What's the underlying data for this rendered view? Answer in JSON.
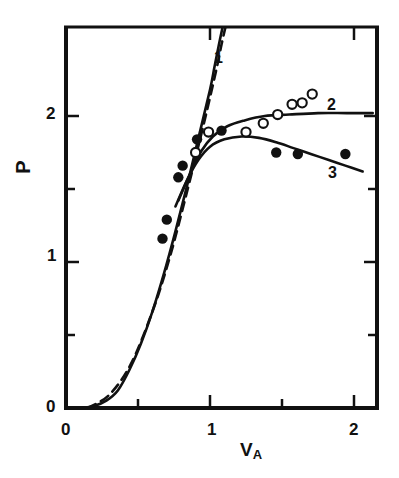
{
  "chart_data": {
    "type": "scatter",
    "title": "",
    "xlabel": "V_A",
    "ylabel": "P",
    "xlim": [
      0,
      2.15
    ],
    "ylim": [
      0,
      2.62
    ],
    "xticks": [
      0,
      1,
      2
    ],
    "xtick_labels": [
      "0",
      "1",
      "2"
    ],
    "xminor_ticks": [
      0.5,
      1.5
    ],
    "yticks": [
      0,
      1,
      2
    ],
    "ytick_labels": [
      "0",
      "1",
      "2"
    ],
    "yminor_ticks": [
      0.5,
      1.5
    ],
    "grid": false,
    "legend_position": "inline-curve-labels",
    "series": [
      {
        "name": "1",
        "kind": "line",
        "style": "solid",
        "label": "1",
        "label_xy": [
          1.05,
          2.44
        ],
        "points": [
          [
            0.12,
            0.0
          ],
          [
            0.2,
            0.015
          ],
          [
            0.28,
            0.05
          ],
          [
            0.36,
            0.12
          ],
          [
            0.44,
            0.26
          ],
          [
            0.52,
            0.44
          ],
          [
            0.6,
            0.66
          ],
          [
            0.68,
            0.92
          ],
          [
            0.76,
            1.21
          ],
          [
            0.84,
            1.52
          ],
          [
            0.92,
            1.85
          ],
          [
            1.0,
            2.18
          ],
          [
            1.03,
            2.33
          ],
          [
            1.06,
            2.48
          ],
          [
            1.09,
            2.62
          ]
        ]
      },
      {
        "name": "1-dashed",
        "kind": "line",
        "style": "dashed",
        "label": "",
        "points": [
          [
            0.15,
            0.0
          ],
          [
            0.3,
            0.09
          ],
          [
            0.45,
            0.3
          ],
          [
            0.6,
            0.66
          ],
          [
            0.72,
            1.03
          ],
          [
            0.84,
            1.48
          ],
          [
            0.96,
            1.96
          ],
          [
            1.04,
            2.3
          ],
          [
            1.08,
            2.49
          ],
          [
            1.11,
            2.62
          ]
        ]
      },
      {
        "name": "2",
        "kind": "line",
        "style": "solid",
        "label": "2",
        "label_xy": [
          1.83,
          2.08
        ],
        "points": [
          [
            0.78,
            1.42
          ],
          [
            0.86,
            1.6
          ],
          [
            0.94,
            1.76
          ],
          [
            1.02,
            1.86
          ],
          [
            1.12,
            1.93
          ],
          [
            1.24,
            1.97
          ],
          [
            1.38,
            2.0
          ],
          [
            1.55,
            2.01
          ],
          [
            1.75,
            2.02
          ],
          [
            1.95,
            2.02
          ],
          [
            2.13,
            2.02
          ]
        ]
      },
      {
        "name": "3",
        "kind": "line",
        "style": "solid",
        "label": "3",
        "label_xy": [
          1.84,
          1.62
        ],
        "points": [
          [
            0.76,
            1.38
          ],
          [
            0.84,
            1.56
          ],
          [
            0.92,
            1.7
          ],
          [
            1.0,
            1.79
          ],
          [
            1.1,
            1.84
          ],
          [
            1.22,
            1.86
          ],
          [
            1.34,
            1.85
          ],
          [
            1.46,
            1.82
          ],
          [
            1.58,
            1.78
          ],
          [
            1.7,
            1.74
          ],
          [
            1.82,
            1.7
          ],
          [
            1.94,
            1.66
          ],
          [
            2.06,
            1.62
          ]
        ]
      },
      {
        "name": "filled-circles",
        "kind": "scatter",
        "marker": "filled-circle",
        "points": [
          [
            0.67,
            1.16
          ],
          [
            0.7,
            1.29
          ],
          [
            0.78,
            1.58
          ],
          [
            0.81,
            1.66
          ],
          [
            0.91,
            1.84
          ],
          [
            1.08,
            1.9
          ],
          [
            1.46,
            1.75
          ],
          [
            1.61,
            1.74
          ],
          [
            1.94,
            1.74
          ]
        ]
      },
      {
        "name": "open-circles",
        "kind": "scatter",
        "marker": "open-circle",
        "points": [
          [
            0.9,
            1.75
          ],
          [
            0.99,
            1.89
          ],
          [
            1.25,
            1.89
          ],
          [
            1.37,
            1.95
          ],
          [
            1.47,
            2.01
          ],
          [
            1.57,
            2.08
          ],
          [
            1.64,
            2.09
          ],
          [
            1.71,
            2.15
          ]
        ]
      }
    ]
  },
  "axes": {
    "y_title": "P",
    "x_title_main": "V",
    "x_title_sub": "A",
    "x_tick_0": "0",
    "x_tick_1": "1",
    "x_tick_2": "2",
    "y_tick_0": "0",
    "y_tick_1": "1",
    "y_tick_2": "2"
  },
  "curve_labels": {
    "one": "1",
    "two": "2",
    "three": "3"
  },
  "colors": {
    "ink": "#111111",
    "background": "#ffffff"
  }
}
